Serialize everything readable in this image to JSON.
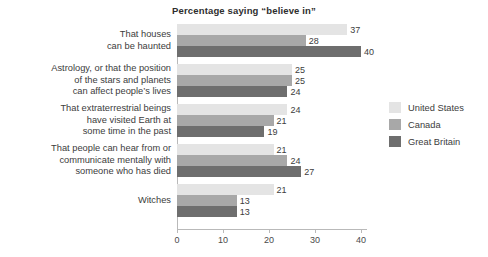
{
  "chart_data": {
    "type": "bar",
    "orientation": "horizontal",
    "title": "Percentage saying “believe in”",
    "xlabel": "",
    "ylabel": "",
    "xlim": [
      0,
      41
    ],
    "xticks": [
      0,
      10,
      20,
      30,
      40
    ],
    "xticklabels": [
      "0",
      "10",
      "20",
      "30",
      "40"
    ],
    "grid": false,
    "legend_position": "right",
    "categories": [
      "That houses\ncan be haunted",
      "Astrology, or that the position\nof the stars and planets\ncan affect people’s lives",
      "That extraterrestrial beings\nhave visited Earth at\nsome time in the past",
      "That people can hear from or\ncommunicate mentally with\nsomeone who has died",
      "Witches"
    ],
    "series": [
      {
        "name": "United States",
        "color": "#e4e4e4",
        "values": [
          37,
          25,
          24,
          21,
          21
        ]
      },
      {
        "name": "Canada",
        "color": "#a8a8a8",
        "values": [
          28,
          25,
          21,
          24,
          13
        ]
      },
      {
        "name": "Great Britain",
        "color": "#6e6e6e",
        "values": [
          40,
          24,
          19,
          27,
          13
        ]
      }
    ]
  },
  "legend": {
    "items": [
      {
        "label": "United States",
        "color": "#e4e4e4"
      },
      {
        "label": "Canada",
        "color": "#a8a8a8"
      },
      {
        "label": "Great Britain",
        "color": "#6e6e6e"
      }
    ]
  },
  "footer": {
    "note": ""
  }
}
